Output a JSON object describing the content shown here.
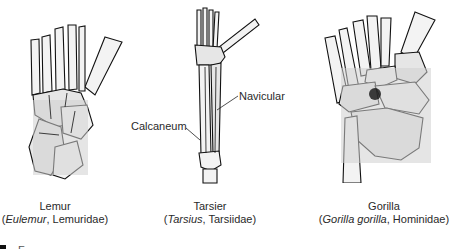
{
  "figure": {
    "panels": [
      {
        "id": "lemur",
        "common_name": "Lemur",
        "genus": "Eulemur",
        "family": "Lemuridae"
      },
      {
        "id": "tarsier",
        "common_name": "Tarsier",
        "genus": "Tarsius",
        "family": "Tarsiidae",
        "callouts": [
          "Navicular",
          "Calcaneum"
        ]
      },
      {
        "id": "gorilla",
        "common_name": "Gorilla",
        "genus": "Gorilla gorilla",
        "family": "Hominidae"
      }
    ],
    "caption_truncated": "F…"
  },
  "punct": {
    "open": "(",
    "sep": ", ",
    "close": ")"
  }
}
